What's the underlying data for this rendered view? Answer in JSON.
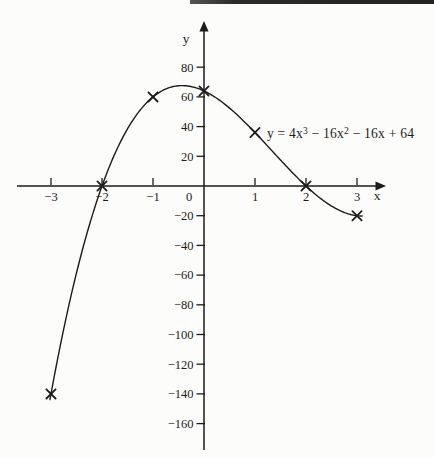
{
  "page": {
    "background_color": "#fcfcfa",
    "top_rule_color": "#2b2b2b"
  },
  "chart_data": {
    "type": "line",
    "title": "",
    "equation_label": "y = 4x³ − 16x² − 16x + 64",
    "equation_parts": {
      "p1": "y = 4x",
      "sup1": "3",
      "p2": " − 16x",
      "sup2": "2",
      "p3": " − 16x + 64"
    },
    "function": {
      "form": "polynomial",
      "coefficients_ascending": [
        64,
        -16,
        -16,
        4
      ]
    },
    "curve_x_range": [
      -3.02,
      3.12
    ],
    "marked_points": [
      [
        -3,
        -140
      ],
      [
        -2,
        0
      ],
      [
        -1,
        60
      ],
      [
        0,
        64
      ],
      [
        1,
        36
      ],
      [
        2,
        0
      ],
      [
        3,
        -20
      ]
    ],
    "x_axis": {
      "label": "x",
      "tick_values": [
        -3,
        -2,
        -1,
        0,
        1,
        2,
        3
      ],
      "range": [
        -3.65,
        3.6
      ]
    },
    "y_axis": {
      "label": "y",
      "tick_values": [
        80,
        60,
        40,
        20,
        -20,
        -40,
        -60,
        -80,
        -100,
        -120,
        -140,
        -160
      ],
      "range": [
        -178,
        97
      ]
    },
    "grid": false,
    "legend_position": "none",
    "ink_color": "#1c1c1c"
  }
}
